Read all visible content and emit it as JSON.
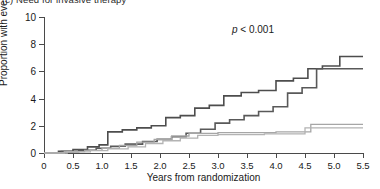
{
  "panel": {
    "title": "(c) Need for invasive therapy"
  },
  "annotations": {
    "p_value_symbol": "p",
    "p_value_text": " < 0.001"
  },
  "chart_data": {
    "type": "line",
    "subtype": "kaplan-meier-cumulative-incidence",
    "title": "(c) Need for invasive therapy",
    "xlabel": "Years from randomization",
    "ylabel": "Proportion with event (%)",
    "xlim": [
      0,
      5.5
    ],
    "ylim": [
      0,
      10
    ],
    "xticks": [
      0,
      0.5,
      1.0,
      1.5,
      2.0,
      2.5,
      3.0,
      3.5,
      4.0,
      4.5,
      5.0,
      5.5
    ],
    "xticklabels": [
      "0",
      "0.5",
      "1.0",
      "1.5",
      "2.0",
      "2.5",
      "3.0",
      "3.5",
      "4.0",
      "4.5",
      "5.0",
      "5.5"
    ],
    "yticks": [
      0,
      2,
      4,
      6,
      8,
      10
    ],
    "yticklabels": [
      "0",
      "2",
      "4",
      "6",
      "8",
      "10"
    ],
    "grid": false,
    "legend": "none",
    "step_type": "post",
    "annotation": "p < 0.001",
    "series": [
      {
        "name": "curve-1-upper-dark",
        "color": "#4d4d4d",
        "width": 1.6,
        "x": [
          0,
          0.25,
          0.5,
          0.75,
          0.95,
          1.1,
          1.35,
          1.6,
          1.85,
          2.1,
          2.35,
          2.6,
          2.85,
          3.1,
          3.4,
          3.7,
          4.0,
          4.3,
          4.55,
          4.8,
          5.1,
          5.5
        ],
        "y": [
          0,
          0.12,
          0.25,
          0.45,
          0.6,
          1.55,
          1.7,
          1.85,
          2.0,
          2.6,
          2.75,
          3.3,
          3.5,
          4.2,
          4.45,
          4.6,
          5.3,
          5.5,
          6.2,
          6.4,
          7.1,
          7.1
        ]
      },
      {
        "name": "curve-2-middle-dark",
        "color": "#595959",
        "width": 1.6,
        "x": [
          0,
          0.3,
          0.6,
          0.9,
          1.15,
          1.4,
          1.7,
          1.95,
          2.2,
          2.45,
          2.7,
          2.95,
          3.2,
          3.45,
          3.7,
          3.95,
          4.2,
          4.45,
          4.7,
          5.0,
          5.5
        ],
        "y": [
          0,
          0.1,
          0.2,
          0.35,
          0.5,
          0.65,
          0.85,
          1.0,
          1.2,
          1.45,
          1.75,
          2.2,
          2.45,
          2.75,
          3.05,
          3.4,
          4.4,
          4.8,
          6.2,
          6.2,
          6.2
        ]
      },
      {
        "name": "curve-3-lower-gray-a",
        "color": "#a6a6a6",
        "width": 1.3,
        "x": [
          0,
          0.35,
          0.7,
          1.0,
          1.3,
          1.6,
          1.9,
          2.2,
          2.5,
          3.0,
          3.5,
          4.0,
          4.3,
          4.6,
          5.0,
          5.5
        ],
        "y": [
          0,
          0.1,
          0.2,
          0.35,
          0.55,
          0.8,
          1.0,
          1.25,
          1.45,
          1.5,
          1.5,
          1.55,
          1.55,
          2.1,
          2.1,
          2.1
        ]
      },
      {
        "name": "curve-4-lower-gray-b",
        "color": "#b3b3b3",
        "width": 1.3,
        "x": [
          0,
          0.4,
          0.8,
          1.1,
          1.45,
          1.75,
          2.05,
          2.35,
          2.65,
          3.0,
          3.4,
          3.8,
          4.15,
          4.5,
          5.0,
          5.5
        ],
        "y": [
          0,
          0.08,
          0.18,
          0.3,
          0.45,
          0.7,
          0.9,
          1.1,
          1.3,
          1.35,
          1.35,
          1.4,
          1.4,
          1.85,
          1.85,
          1.85
        ]
      }
    ]
  }
}
